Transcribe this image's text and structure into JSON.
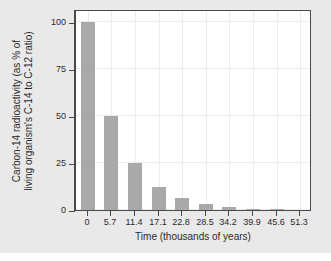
{
  "chart_data": {
    "type": "bar",
    "title": "",
    "xlabel": "Time (thousands of years)",
    "ylabel_lines": [
      "Carbon-14 radioactivity (as % of",
      "living organism's C-14 to C-12 ratio)"
    ],
    "ylabel": "Carbon-14 radioactivity (as % of living organism's C-14 to C-12 ratio)",
    "categories": [
      "0",
      "5.7",
      "11.4",
      "17.1",
      "22.8",
      "28.5",
      "34.2",
      "39.9",
      "45.6",
      "51.3"
    ],
    "x": [
      0,
      5.7,
      11.4,
      17.1,
      22.8,
      28.5,
      34.2,
      39.9,
      45.6,
      51.3
    ],
    "values": [
      100,
      50,
      25,
      12.5,
      6.25,
      3.13,
      1.56,
      0.78,
      0.39,
      0.2
    ],
    "xtick_labels": [
      "0",
      "5.7",
      "11.4",
      "17.1",
      "22.8",
      "28.5",
      "34.2",
      "39.9",
      "45.6",
      "51.3"
    ],
    "ytick_labels": [
      "0",
      "25",
      "50",
      "75",
      "100"
    ],
    "yticks": [
      0,
      25,
      50,
      75,
      100
    ],
    "ylim": [
      0,
      107
    ],
    "xlim": [
      -2.85,
      54.15
    ],
    "grid": true,
    "legend": "none",
    "bar_color": "#a9a9a9",
    "plot_background": "#ffffff",
    "figure_background": "#e9e9e9",
    "axis_color": "#4a4a4a",
    "gridline_color": "#ededed"
  }
}
